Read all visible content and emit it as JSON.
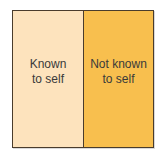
{
  "diagram": {
    "panes": [
      {
        "line1": "Known",
        "line2": "to self",
        "color": "#fde3bd"
      },
      {
        "line1": "Not known",
        "line2": "to self",
        "color": "#f8bf4e"
      }
    ],
    "border_color": "#4a3c2c"
  }
}
